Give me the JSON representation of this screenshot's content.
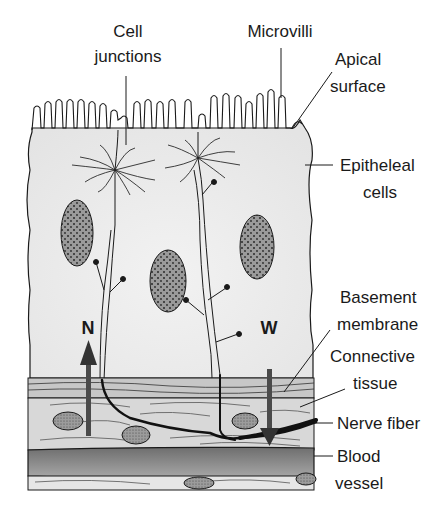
{
  "figure": {
    "type": "anatomical-diagram"
  },
  "labels": {
    "cell_junctions": [
      "Cell",
      "junctions"
    ],
    "microvilli": "Microvilli",
    "apical_surface": [
      "Apical",
      "surface"
    ],
    "epithelial_cells": [
      "Epitheleal",
      "cells"
    ],
    "basement_membrane": [
      "Basement",
      "membrane"
    ],
    "connective_tissue": [
      "Connective",
      "tissue"
    ],
    "nerve_fiber": "Nerve fiber",
    "blood_vessel": [
      "Blood",
      "vessel"
    ],
    "arrow_n": "N",
    "arrow_w": "W"
  },
  "colors": {
    "line": "#1a1a1a",
    "cytoplasm": "#ececec",
    "nucleus": "#8a8a8a",
    "connective": "#d6d6d6",
    "basement": "#bdbdbd",
    "blood_vessel": "#7a7a7a",
    "arrow": "#4a4a4a"
  }
}
